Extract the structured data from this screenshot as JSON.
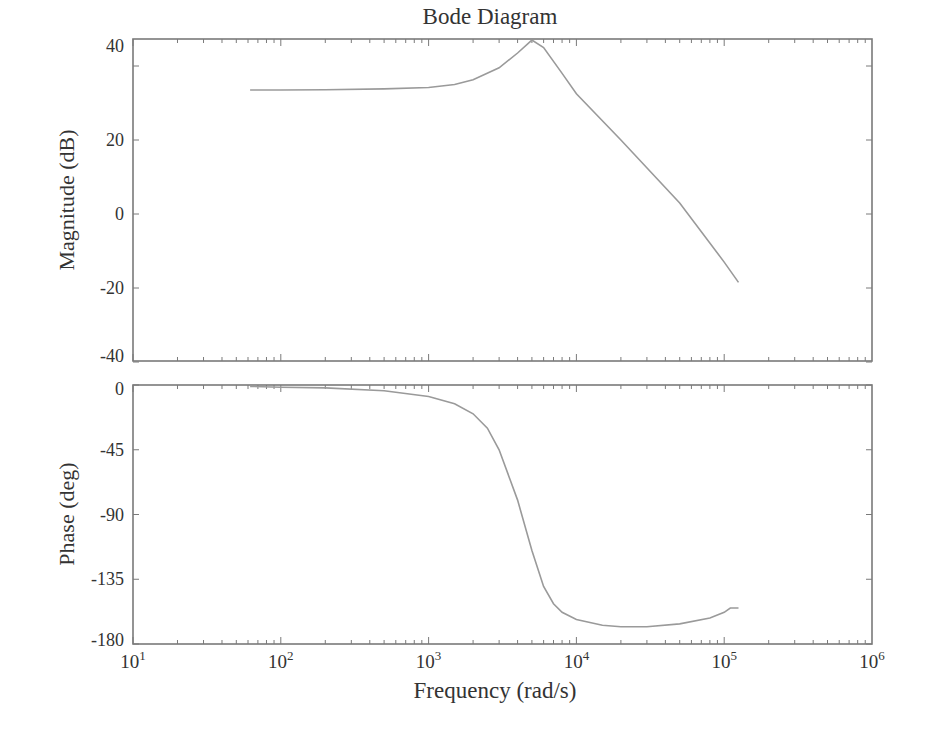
{
  "chart_data": {
    "type": "line",
    "title": "Bode Diagram",
    "xlabel": "Frequency (rad/s)",
    "xscale": "log",
    "xlim": [
      10,
      1000000
    ],
    "x_tick_labels": [
      {
        "base": "10",
        "exp": "1",
        "value": 10
      },
      {
        "base": "10",
        "exp": "2",
        "value": 100
      },
      {
        "base": "10",
        "exp": "3",
        "value": 1000
      },
      {
        "base": "10",
        "exp": "4",
        "value": 10000
      },
      {
        "base": "10",
        "exp": "5",
        "value": 100000
      },
      {
        "base": "10",
        "exp": "6",
        "value": 1000000
      }
    ],
    "grid": false,
    "subplots": [
      {
        "name": "magnitude",
        "ylabel": "Magnitude (dB)",
        "ylim": [
          -40,
          47
        ],
        "yticks": [
          40,
          20,
          0,
          -20,
          -40
        ],
        "series": [
          {
            "name": "Magnitude",
            "x": [
              62,
              100,
              200,
              500,
              1000,
              1500,
              2000,
              3000,
              4000,
              5000,
              6000,
              8000,
              10000,
              20000,
              50000,
              100000,
              125000
            ],
            "y": [
              33.5,
              33.5,
              33.6,
              33.8,
              34.2,
              35.0,
              36.3,
              39.5,
              43.5,
              47.0,
              45.0,
              38.0,
              32.5,
              20.0,
              3.0,
              -13.0,
              -18.5
            ]
          }
        ]
      },
      {
        "name": "phase",
        "ylabel": "Phase (deg)",
        "ylim": [
          -180,
          0
        ],
        "yticks": [
          0,
          -45,
          -90,
          -135,
          -180
        ],
        "series": [
          {
            "name": "Phase",
            "x": [
              62,
              100,
              200,
              500,
              1000,
              1500,
              2000,
              2500,
              3000,
              4000,
              5000,
              6000,
              7000,
              8000,
              10000,
              15000,
              20000,
              30000,
              50000,
              80000,
              100000,
              110000,
              125000
            ],
            "y": [
              -1,
              -1.5,
              -2,
              -4,
              -8,
              -13,
              -20,
              -30,
              -45,
              -80,
              -115,
              -140,
              -152,
              -158,
              -163,
              -167,
              -168,
              -168,
              -166,
              -162,
              -158,
              -155,
              -155
            ]
          }
        ]
      }
    ]
  },
  "labels": {
    "title": "Bode Diagram",
    "xlabel": "Frequency (rad/s)",
    "mag_ylabel": "Magnitude (dB)",
    "phase_ylabel": "Phase (deg)"
  }
}
